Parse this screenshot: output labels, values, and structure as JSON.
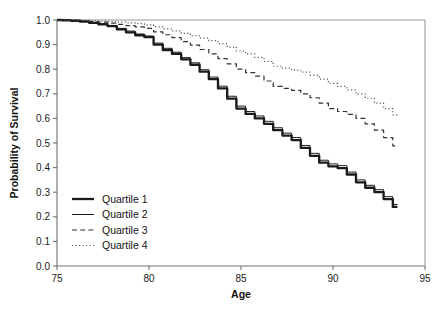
{
  "chart_data": {
    "type": "line",
    "title": "",
    "xlabel": "Age",
    "ylabel": "Probability of Survival",
    "xlim": [
      75,
      95
    ],
    "ylim": [
      0.0,
      1.0
    ],
    "grid": false,
    "legend_position": "lower-left",
    "x_ticks": [
      75,
      80,
      85,
      90,
      95
    ],
    "x_tick_labels": [
      "75",
      "80",
      "85",
      "90",
      "95"
    ],
    "y_ticks": [
      0.0,
      0.1,
      0.2,
      0.3,
      0.4,
      0.5,
      0.6,
      0.7,
      0.8,
      0.9,
      1.0
    ],
    "y_tick_labels": [
      "0.0",
      "0.1",
      "0.2",
      "0.3",
      "0.4",
      "0.5",
      "0.6",
      "0.7",
      "0.8",
      "0.9",
      "1.0"
    ],
    "x": [
      75.0,
      75.5,
      76.0,
      76.5,
      77.0,
      77.5,
      78.0,
      78.5,
      79.0,
      79.5,
      80.0,
      80.5,
      81.0,
      81.5,
      82.0,
      82.5,
      83.0,
      83.5,
      84.0,
      84.5,
      85.0,
      85.5,
      86.0,
      86.5,
      87.0,
      87.5,
      88.0,
      88.5,
      89.0,
      89.5,
      90.0,
      90.5,
      91.0,
      91.5,
      92.0,
      92.5,
      93.0,
      93.5
    ],
    "series": [
      {
        "name": "Quartile 1",
        "style": "solid-thick",
        "color": "#1a1a1a",
        "values": [
          1.0,
          0.999,
          0.997,
          0.993,
          0.988,
          0.982,
          0.975,
          0.962,
          0.95,
          0.938,
          0.93,
          0.9,
          0.878,
          0.862,
          0.84,
          0.818,
          0.79,
          0.76,
          0.722,
          0.68,
          0.64,
          0.618,
          0.6,
          0.578,
          0.552,
          0.53,
          0.512,
          0.48,
          0.448,
          0.42,
          0.405,
          0.398,
          0.372,
          0.34,
          0.318,
          0.3,
          0.272,
          0.24
        ]
      },
      {
        "name": "Quartile 2",
        "style": "solid-thin",
        "color": "#1a1a1a",
        "values": [
          1.0,
          0.999,
          0.998,
          0.995,
          0.99,
          0.985,
          0.978,
          0.966,
          0.955,
          0.943,
          0.935,
          0.906,
          0.885,
          0.869,
          0.847,
          0.826,
          0.798,
          0.768,
          0.731,
          0.69,
          0.65,
          0.628,
          0.61,
          0.588,
          0.562,
          0.54,
          0.522,
          0.49,
          0.458,
          0.43,
          0.415,
          0.408,
          0.382,
          0.35,
          0.328,
          0.31,
          0.282,
          0.25
        ]
      },
      {
        "name": "Quartile 3",
        "style": "dashed",
        "color": "#333333",
        "values": [
          1.0,
          1.0,
          0.999,
          0.997,
          0.994,
          0.991,
          0.987,
          0.982,
          0.977,
          0.972,
          0.966,
          0.952,
          0.94,
          0.928,
          0.912,
          0.898,
          0.88,
          0.862,
          0.843,
          0.822,
          0.8,
          0.786,
          0.772,
          0.752,
          0.73,
          0.722,
          0.714,
          0.7,
          0.684,
          0.662,
          0.64,
          0.628,
          0.616,
          0.6,
          0.578,
          0.552,
          0.522,
          0.488
        ]
      },
      {
        "name": "Quartile 4",
        "style": "dotted",
        "color": "#4d4d4d",
        "values": [
          1.0,
          1.0,
          1.0,
          0.999,
          0.998,
          0.996,
          0.994,
          0.991,
          0.988,
          0.985,
          0.98,
          0.972,
          0.964,
          0.956,
          0.946,
          0.936,
          0.926,
          0.916,
          0.904,
          0.89,
          0.874,
          0.862,
          0.848,
          0.832,
          0.812,
          0.804,
          0.796,
          0.788,
          0.776,
          0.76,
          0.742,
          0.73,
          0.716,
          0.7,
          0.682,
          0.662,
          0.64,
          0.614
        ]
      }
    ]
  },
  "legend": {
    "items": [
      {
        "label": "Quartile 1"
      },
      {
        "label": "Quartile 2"
      },
      {
        "label": "Quartile 3"
      },
      {
        "label": "Quartile 4"
      }
    ]
  }
}
